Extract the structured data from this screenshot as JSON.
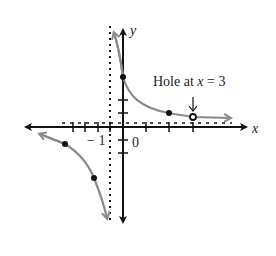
{
  "diagram": {
    "type": "rational-function-graph",
    "axes": {
      "x_label": "x",
      "y_label": "y",
      "origin_label": "0",
      "neg_one_label": "− 1"
    },
    "annotation": {
      "text_prefix": "Hole at ",
      "text_var": "x",
      "text_suffix": " = 3",
      "arrow": "↓"
    },
    "asymptotes": {
      "vertical": "x = -1",
      "horizontal": "y near 0 (dotted, slightly above x-axis)"
    },
    "points": {
      "filled": [
        [
          0,
          4
        ],
        [
          2,
          1
        ],
        [
          -4,
          -1
        ],
        [
          -2,
          -3
        ]
      ],
      "open": [
        [
          3,
          0.75
        ]
      ]
    },
    "colors": {
      "axis": "#111111",
      "curve": "#8a8a8a",
      "point": "#111111",
      "asymptote": "#111111"
    }
  }
}
